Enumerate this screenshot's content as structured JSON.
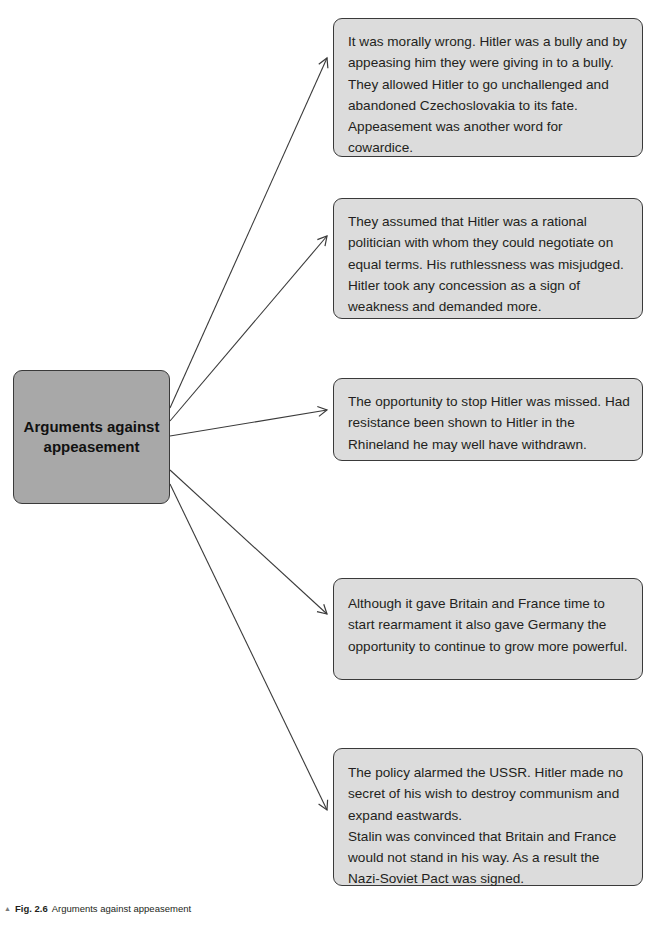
{
  "diagram": {
    "type": "spider-diagram",
    "central_node": {
      "label": "Arguments against appeasement"
    },
    "arguments": [
      {
        "id": 1,
        "paragraphs": [
          "It was morally wrong. Hitler was a bully and by appeasing him they were giving in to a bully. They allowed Hitler to go unchallenged and abandoned Czechoslovakia to its fate. Appeasement was another word for cowardice."
        ]
      },
      {
        "id": 2,
        "paragraphs": [
          "They assumed that Hitler was a rational politician with whom they could negotiate on equal terms. His ruthlessness was misjudged. Hitler took any concession as a sign of weakness and demanded more."
        ]
      },
      {
        "id": 3,
        "paragraphs": [
          "The opportunity to stop Hitler was missed. Had resistance been shown to Hitler in the Rhineland he may well have withdrawn."
        ]
      },
      {
        "id": 4,
        "paragraphs": [
          "Although it gave Britain and France time to start rearmament it also gave Germany the opportunity to continue to grow more powerful."
        ]
      },
      {
        "id": 5,
        "paragraphs": [
          "The policy alarmed the USSR. Hitler made no secret of his wish to destroy communism and expand eastwards.",
          "Stalin was convinced that Britain and France would not stand in his way. As a result the Nazi-Soviet Pact was signed."
        ]
      }
    ],
    "colors": {
      "central_fill": "#a8a8a8",
      "argument_fill": "#dcdcdc",
      "border": "#3a3a3a",
      "arrow": "#3a3a3a"
    }
  },
  "caption": {
    "marker": "▲",
    "figure_label": "Fig. 2.6",
    "text": "Arguments against appeasement"
  }
}
